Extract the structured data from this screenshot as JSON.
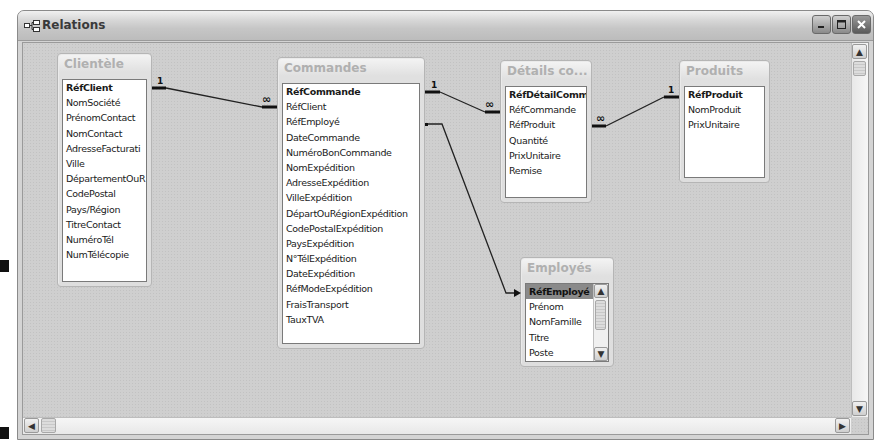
{
  "window": {
    "title": "Relations",
    "icon": "relationships-icon",
    "controls": {
      "minimize": "minimize-icon",
      "maximize": "maximize-icon",
      "close": "close-icon"
    }
  },
  "tables": {
    "clientele": {
      "title": "Clientèle",
      "fields": [
        "RéfClient",
        "NomSociété",
        "PrénomContact",
        "NomContact",
        "AdresseFacturati",
        "Ville",
        "DépartementOuR",
        "CodePostal",
        "Pays/Région",
        "TitreContact",
        "NuméroTél",
        "NumTélécopie"
      ]
    },
    "commandes": {
      "title": "Commandes",
      "fields": [
        "RéfCommande",
        "RéfClient",
        "RéfEmployé",
        "DateCommande",
        "NuméroBonCommande",
        "NomExpédition",
        "AdresseExpédition",
        "VilleExpédition",
        "DépartOuRégionExpédition",
        "CodePostalExpédition",
        "PaysExpédition",
        "N°TélExpédition",
        "DateExpédition",
        "RéfModeExpédition",
        "FraisTransport",
        "TauxTVA"
      ]
    },
    "details": {
      "title": "Détails co...",
      "fields": [
        "RéfDétailCommar",
        "RéfCommande",
        "RéfProduit",
        "Quantité",
        "PrixUnitaire",
        "Remise"
      ]
    },
    "produits": {
      "title": "Produits",
      "fields": [
        "RéfProduit",
        "NomProduit",
        "PrixUnitaire"
      ]
    },
    "employes": {
      "title": "Employés",
      "fields": [
        "RéfEmployé",
        "Prénom",
        "NomFamille",
        "Titre",
        "Poste"
      ]
    }
  },
  "relationships": [
    {
      "from": "Clientèle.RéfClient",
      "to": "Commandes.RéfClient",
      "from_label": "1",
      "to_label": "∞"
    },
    {
      "from": "Commandes.RéfCommande",
      "to": "Détails commandes.RéfCommande",
      "from_label": "1",
      "to_label": "∞"
    },
    {
      "from": "Produits.RéfProduit",
      "to": "Détails commandes.RéfProduit",
      "from_label": "1",
      "to_label": "∞"
    },
    {
      "from": "Commandes.RéfEmployé",
      "to": "Employés.RéfEmployé",
      "from_label": "",
      "to_label": ""
    }
  ],
  "scrollbars": {
    "up": "▲",
    "down": "▼",
    "left": "◀",
    "right": "▶"
  }
}
